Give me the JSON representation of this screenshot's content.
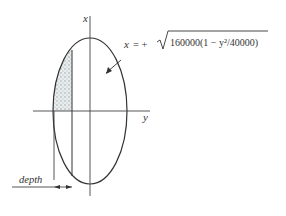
{
  "diagram": {
    "axis_x_label": "x",
    "axis_y_label": "y",
    "equation": {
      "lhs": "x",
      "rhs_prefix": "= +",
      "radicand": "160000(1 − y²/40000)"
    },
    "depth_label": "depth",
    "colors": {
      "stroke": "#333333",
      "shading": "#9aa5a5"
    }
  }
}
